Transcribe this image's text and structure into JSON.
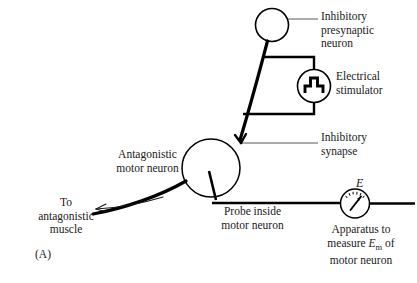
{
  "figure": {
    "panel_label": "(A)",
    "type": "neuroscience-circuit-diagram",
    "background_color": "#ffffff",
    "stroke_color": "#000000",
    "leader_color": "#555555"
  },
  "labels": {
    "presynaptic_neuron": "Inhibitory\npresynaptic\nneuron",
    "electrical_stimulator": "Electrical\nstimulator",
    "inhibitory_synapse": "Inhibitory\nsynapse",
    "antagonistic_motor_neuron": "Antagonistic\nmotor neuron",
    "probe": "Probe inside\nmotor neuron",
    "to_muscle": "To\nantagonistic\nmuscle",
    "apparatus_line1": "Apparatus to",
    "apparatus_line2_pre": "measure ",
    "apparatus_line2_var": "E",
    "apparatus_line2_sub": "m",
    "apparatus_line2_post": " of",
    "apparatus_line3": "motor neuron",
    "meter_symbol": "E"
  },
  "elements": {
    "presynaptic_neuron_soma": "circle",
    "motor_neuron_soma": "circle",
    "stimulator_device": "square-pulse-meter",
    "voltmeter": "dial-meter",
    "axon_to_muscle": "curved-arrow-left",
    "synapse_terminal": "inhibitory-terminal"
  }
}
